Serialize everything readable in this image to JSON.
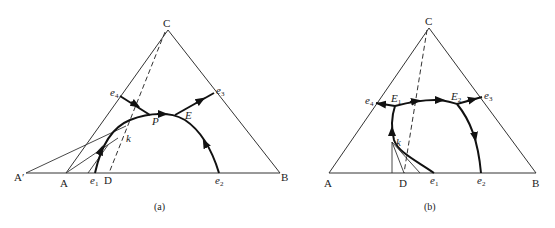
{
  "figure_a": {
    "caption": "(a)",
    "vertices": {
      "C": "C",
      "A": "A",
      "B": "B",
      "A_prime": "A′",
      "D": "D"
    },
    "points": {
      "e1": "e",
      "e1_sub": "1",
      "e2": "e",
      "e2_sub": "2",
      "e3": "e",
      "e3_sub": "3",
      "e4": "e",
      "e4_sub": "4",
      "P": "P",
      "E": "E",
      "k": "k"
    }
  },
  "figure_b": {
    "caption": "(b)",
    "vertices": {
      "C": "C",
      "A": "A",
      "B": "B",
      "D": "D"
    },
    "points": {
      "e1": "e",
      "e1_sub": "1",
      "e2": "e",
      "e2_sub": "2",
      "e3": "e",
      "e3_sub": "3",
      "e4": "e",
      "e4_sub": "4",
      "E1": "E",
      "E1_sub": "1",
      "E2": "E",
      "E2_sub": "2",
      "k": "k"
    }
  }
}
